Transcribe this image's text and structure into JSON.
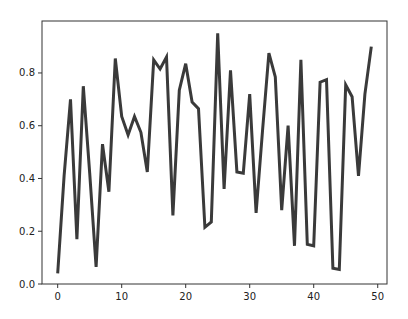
{
  "chart_data": {
    "type": "line",
    "title": "",
    "xlabel": "",
    "ylabel": "",
    "xlim": [
      -2.45,
      51.45
    ],
    "ylim": [
      0.0,
      0.997
    ],
    "grid": false,
    "legend": null,
    "xticks": [
      0,
      10,
      20,
      30,
      40,
      50
    ],
    "xtick_labels": [
      "0",
      "10",
      "20",
      "30",
      "40",
      "50"
    ],
    "yticks": [
      0.0,
      0.2,
      0.4,
      0.6,
      0.8
    ],
    "ytick_labels": [
      "0.0",
      "0.2",
      "0.4",
      "0.6",
      "0.8"
    ],
    "series": [
      {
        "name": "series",
        "color": "#3a3a3a",
        "line_width": 3,
        "x": [
          0,
          1,
          2,
          3,
          4,
          5,
          6,
          7,
          8,
          9,
          10,
          11,
          12,
          13,
          14,
          15,
          16,
          17,
          18,
          19,
          20,
          21,
          22,
          23,
          24,
          25,
          26,
          27,
          28,
          29,
          30,
          31,
          32,
          33,
          34,
          35,
          36,
          37,
          38,
          39,
          40,
          41,
          42,
          43,
          44,
          45,
          46,
          47,
          48,
          49
        ],
        "values": [
          0.04,
          0.41,
          0.7,
          0.17,
          0.75,
          0.42,
          0.065,
          0.53,
          0.35,
          0.855,
          0.635,
          0.565,
          0.635,
          0.575,
          0.425,
          0.85,
          0.815,
          0.86,
          0.26,
          0.735,
          0.835,
          0.69,
          0.665,
          0.215,
          0.235,
          0.95,
          0.36,
          0.81,
          0.425,
          0.42,
          0.72,
          0.27,
          0.58,
          0.875,
          0.785,
          0.28,
          0.6,
          0.145,
          0.85,
          0.15,
          0.145,
          0.765,
          0.775,
          0.06,
          0.055,
          0.755,
          0.71,
          0.41,
          0.72,
          0.9
        ]
      }
    ]
  }
}
